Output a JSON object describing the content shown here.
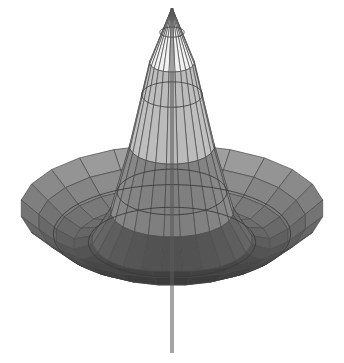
{
  "figure": {
    "title": "",
    "caption": "",
    "kind": "3d-surface-plot",
    "background_color": "#ffffff",
    "mesh_line_color": "#4a4a4a",
    "contour_line_color": "#3a3a3a",
    "axis_line_color": "#5a5a5a"
  },
  "chart_data": {
    "type": "surface",
    "title": "",
    "subtitle": "",
    "xlabel": "",
    "ylabel": "",
    "zlabel": "",
    "projection": "orthographic",
    "legend": "none",
    "grid": true,
    "colormap": "grayscale",
    "colormap_stops": [
      "#ffffff",
      "#f2f2f2",
      "#dedede",
      "#c6c6c6",
      "#b0b0b0",
      "#9a9a9a",
      "#828282",
      "#6a6a6a",
      "#4e4e4e",
      "#323232",
      "#161616",
      "#000000"
    ],
    "shading": "height-mapped-grayscale",
    "view": {
      "elevation_deg": 26,
      "azimuth_deg": 45,
      "scale_x": 152,
      "scale_y": 138,
      "z_scale": 178
    },
    "grid_resolution": {
      "radial_divisions": 8,
      "angular_divisions": 24
    },
    "contours": {
      "count": 5,
      "levels": [
        0.08,
        0.2,
        0.36,
        0.55,
        0.78
      ]
    },
    "surface_function": {
      "form": "peak_minus_ring",
      "peak_amplitude": 1.0,
      "trough_depth": -0.34,
      "ring_radius": 0.58,
      "falloff": 2.2
    },
    "key_points": {
      "apex": {
        "x_px": 172,
        "y_px": 8,
        "value": 1.0,
        "color": "#ffffff"
      },
      "center": {
        "x_px": 172,
        "y_px": 186,
        "value": 0.0
      },
      "left_tip": {
        "x_px": 19,
        "y_px": 186
      },
      "right_tip": {
        "x_px": 325,
        "y_px": 186
      },
      "valley": {
        "x_px": 175,
        "y_px": 353,
        "value": -1.0,
        "color": "#000000"
      }
    },
    "axis_ticks": {
      "x": [],
      "y": [],
      "z": []
    },
    "annotations": []
  }
}
